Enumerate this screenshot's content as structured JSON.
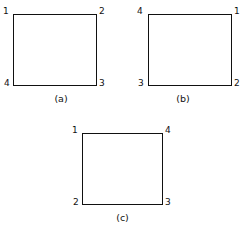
{
  "figure": {
    "background_color": "#ffffff",
    "line_color": "#111111",
    "panels": [
      {
        "id": "a",
        "caption": "(a)",
        "shape": "square",
        "vertex_labels": {
          "top_left": "1",
          "top_right": "2",
          "bottom_right": "3",
          "bottom_left": "4"
        }
      },
      {
        "id": "b",
        "caption": "(b)",
        "shape": "square",
        "vertex_labels": {
          "top_left": "4",
          "top_right": "1",
          "bottom_right": "2",
          "bottom_left": "3"
        }
      },
      {
        "id": "c",
        "caption": "(c)",
        "shape": "square",
        "vertex_labels": {
          "top_left": "1",
          "top_right": "4",
          "bottom_right": "3",
          "bottom_left": "2"
        }
      }
    ]
  }
}
